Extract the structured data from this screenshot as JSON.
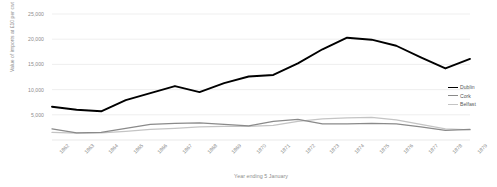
{
  "chart_data": {
    "type": "line",
    "title": "",
    "xlabel": "Year ending 5 January",
    "ylabel": "Value of imports at £10 per cwt",
    "x": [
      1862,
      1863,
      1864,
      1865,
      1866,
      1867,
      1868,
      1869,
      1870,
      1871,
      1872,
      1873,
      1874,
      1875,
      1876,
      1877,
      1878,
      1879
    ],
    "categories": [
      "1862",
      "1863",
      "1864",
      "1865",
      "1866",
      "1867",
      "1868",
      "1869",
      "1870",
      "1871",
      "1872",
      "1873",
      "1874",
      "1875",
      "1876",
      "1877",
      "1878",
      "1879"
    ],
    "xlim": [
      1862,
      1879
    ],
    "ylim": [
      0,
      25000
    ],
    "yticks": [
      5000,
      10000,
      15000,
      20000,
      25000
    ],
    "ytick_labels": [
      "5,000",
      "10,000",
      "15,000",
      "20,000",
      "25,000"
    ],
    "grid": "horizontal",
    "legend_position": "right",
    "series": [
      {
        "name": "Dublin",
        "color": "#000000",
        "width": 1.9,
        "values": [
          6600,
          6000,
          5700,
          7900,
          9300,
          10700,
          9500,
          11300,
          12600,
          12900,
          15200,
          18000,
          20300,
          19900,
          18700,
          16400,
          14200,
          16100
        ]
      },
      {
        "name": "Cork",
        "color": "#8a8a8a",
        "width": 1.3,
        "values": [
          2200,
          1400,
          1500,
          2300,
          3100,
          3300,
          3400,
          3100,
          2800,
          3700,
          4100,
          3200,
          3200,
          3300,
          3200,
          2600,
          1900,
          2100
        ]
      },
      {
        "name": "Belfast",
        "color": "#c4c4c4",
        "width": 1.3,
        "values": [
          1500,
          1350,
          1400,
          1700,
          2100,
          2300,
          2600,
          2700,
          2700,
          2900,
          3700,
          4200,
          4400,
          4500,
          4000,
          3100,
          2200,
          2000
        ]
      }
    ]
  },
  "legend": {
    "items": [
      {
        "label": "Dublin"
      },
      {
        "label": "Cork"
      },
      {
        "label": "Belfast"
      }
    ]
  }
}
